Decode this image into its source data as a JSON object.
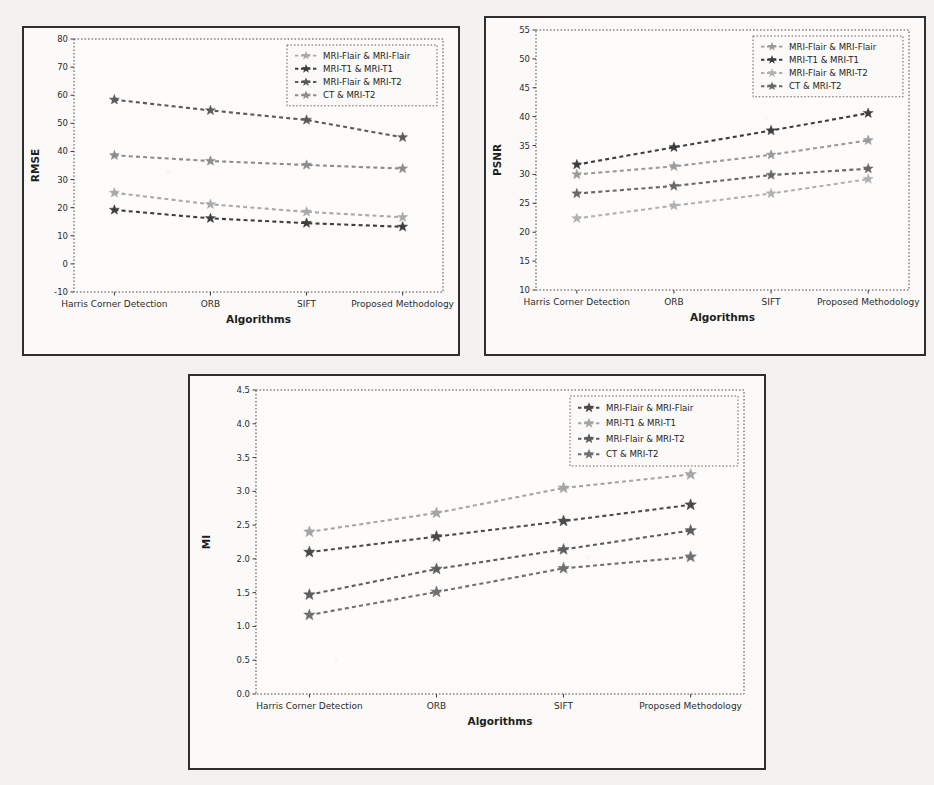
{
  "figures": [
    {
      "id": "fig-rmse",
      "name": "rmse-chart",
      "chart_data": {
        "type": "line",
        "title": "",
        "xlabel": "Algorithms",
        "ylabel": "RMSE",
        "categories": [
          "Harris Corner Detection",
          "ORB",
          "SIFT",
          "Proposed Methodology"
        ],
        "ylim": [
          -10,
          80
        ],
        "yticks": [
          -10,
          0,
          10,
          20,
          30,
          40,
          50,
          60,
          70,
          80
        ],
        "ytick_labels": [
          "-10",
          "0",
          "10",
          "20",
          "30",
          "40",
          "50",
          "60",
          "70",
          "80"
        ],
        "grid": false,
        "legend_position": "upper right",
        "series": [
          {
            "name": "MRI-Flair & MRI-Flair",
            "color": "#a9a9a9",
            "values": [
              25.3,
              21.2,
              18.5,
              16.6
            ]
          },
          {
            "name": "MRI-T1 & MRI-T1",
            "color": "#3d3d3d",
            "values": [
              19.2,
              16.2,
              14.5,
              13.2
            ]
          },
          {
            "name": "MRI-Flair & MRI-T2",
            "color": "#5a5a5a",
            "values": [
              58.4,
              54.6,
              51.2,
              45.0
            ]
          },
          {
            "name": "CT & MRI-T2",
            "color": "#8c8c8c",
            "values": [
              38.6,
              36.6,
              35.2,
              33.9
            ]
          }
        ]
      }
    },
    {
      "id": "fig-psnr",
      "name": "psnr-chart",
      "chart_data": {
        "type": "line",
        "title": "",
        "xlabel": "Algorithms",
        "ylabel": "PSNR",
        "categories": [
          "Harris Corner Detection",
          "ORB",
          "SIFT",
          "Proposed Methodology"
        ],
        "ylim": [
          10,
          55
        ],
        "yticks": [
          10,
          15,
          20,
          25,
          30,
          35,
          40,
          45,
          50,
          55
        ],
        "ytick_labels": [
          "10",
          "15",
          "20",
          "25",
          "30",
          "35",
          "40",
          "45",
          "50",
          "55"
        ],
        "grid": false,
        "legend_position": "upper right",
        "series": [
          {
            "name": "MRI-Flair & MRI-Flair",
            "color": "#9a9a9a",
            "values": [
              30.0,
              31.4,
              33.4,
              35.9
            ]
          },
          {
            "name": "MRI-T1 & MRI-T1",
            "color": "#3d3d3d",
            "values": [
              31.7,
              34.7,
              37.6,
              40.6
            ]
          },
          {
            "name": "MRI-Flair & MRI-T2",
            "color": "#b0b0b0",
            "values": [
              22.4,
              24.6,
              26.7,
              29.2
            ]
          },
          {
            "name": "CT & MRI-T2",
            "color": "#676767",
            "values": [
              26.7,
              28.0,
              29.9,
              31.0
            ]
          }
        ]
      }
    },
    {
      "id": "fig-mi",
      "name": "mi-chart",
      "chart_data": {
        "type": "line",
        "title": "",
        "xlabel": "Algorithms",
        "ylabel": "MI",
        "categories": [
          "Harris Corner Detection",
          "ORB",
          "SIFT",
          "Proposed Methodology"
        ],
        "ylim": [
          0.0,
          4.5
        ],
        "yticks": [
          0.0,
          0.5,
          1.0,
          1.5,
          2.0,
          2.5,
          3.0,
          3.5,
          4.0,
          4.5
        ],
        "ytick_labels": [
          "0.0",
          "0.5",
          "1.0",
          "1.5",
          "2.0",
          "2.5",
          "3.0",
          "3.5",
          "4.0",
          "4.5"
        ],
        "grid": false,
        "legend_position": "upper right",
        "series": [
          {
            "name": "MRI-Flair & MRI-Flair",
            "color": "#4a4a4a",
            "values": [
              2.1,
              2.33,
              2.56,
              2.8
            ]
          },
          {
            "name": "MRI-T1 & MRI-T1",
            "color": "#a5a5a5",
            "values": [
              2.4,
              2.68,
              3.05,
              3.25
            ]
          },
          {
            "name": "MRI-Flair & MRI-T2",
            "color": "#5d5d5d",
            "values": [
              1.47,
              1.85,
              2.14,
              2.42
            ]
          },
          {
            "name": "CT & MRI-T2",
            "color": "#707070",
            "values": [
              1.17,
              1.51,
              1.86,
              2.03
            ]
          }
        ]
      }
    }
  ]
}
